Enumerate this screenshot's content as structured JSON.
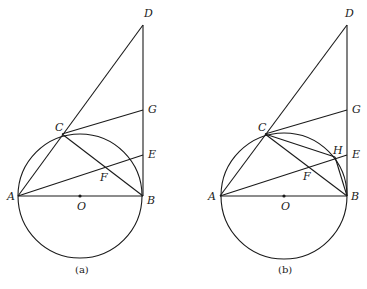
{
  "figures": [
    {
      "id": "a",
      "caption": "(a)",
      "circle": {
        "cx": 80,
        "cy": 196,
        "r": 62
      },
      "points": {
        "A": {
          "x": 18,
          "y": 196,
          "label": "A"
        },
        "B": {
          "x": 143,
          "y": 196,
          "label": "B"
        },
        "O": {
          "x": 80,
          "y": 196,
          "label": "O"
        },
        "C": {
          "x": 62,
          "y": 134,
          "label": "C"
        },
        "D": {
          "x": 143,
          "y": 25,
          "label": "D"
        },
        "G": {
          "x": 143,
          "y": 110,
          "label": "G"
        },
        "E": {
          "x": 143,
          "y": 155,
          "label": "E"
        },
        "F": {
          "x": 104,
          "y": 169,
          "label": "F"
        }
      },
      "segments": [
        "AB",
        "AD",
        "BD",
        "CG",
        "CB",
        "AE"
      ]
    },
    {
      "id": "b",
      "caption": "(b)",
      "circle": {
        "cx": 284,
        "cy": 196,
        "r": 63
      },
      "points": {
        "A": {
          "x": 220,
          "y": 196,
          "label": "A"
        },
        "B": {
          "x": 347,
          "y": 196,
          "label": "B"
        },
        "O": {
          "x": 284,
          "y": 196,
          "label": "O"
        },
        "C": {
          "x": 265,
          "y": 134,
          "label": "C"
        },
        "D": {
          "x": 347,
          "y": 25,
          "label": "D"
        },
        "G": {
          "x": 347,
          "y": 110,
          "label": "G"
        },
        "E": {
          "x": 347,
          "y": 155,
          "label": "E"
        },
        "H": {
          "x": 335,
          "y": 157,
          "label": "H"
        },
        "F": {
          "x": 306,
          "y": 166,
          "label": "F"
        }
      },
      "segments": [
        "AB",
        "AD",
        "BD",
        "CG",
        "CB",
        "AE",
        "CH",
        "HB"
      ]
    }
  ]
}
